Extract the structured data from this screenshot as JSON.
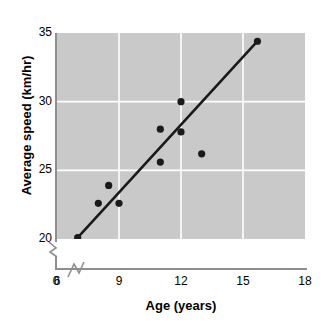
{
  "chart_data": {
    "type": "scatter",
    "title": "",
    "xlabel": "Age (years)",
    "ylabel": "Average speed (km/hr)",
    "xlim": [
      6,
      18
    ],
    "ylim": [
      20,
      35
    ],
    "xticks": [
      0,
      6,
      9,
      12,
      15,
      18
    ],
    "yticks": [
      20,
      25,
      30,
      35
    ],
    "xtick_labels": [
      "0",
      "6",
      "9",
      "12",
      "15",
      "18"
    ],
    "ytick_labels": [
      "20",
      "25",
      "30",
      "35"
    ],
    "grid": true,
    "grid_color": "#ffffff",
    "plot_background": "#c9c9c9",
    "axis_break_x": true,
    "axis_break_y": true,
    "marker_color": "#1a1a1a",
    "marker_shape": "circle",
    "x": [
      7.0,
      8.0,
      8.5,
      9.0,
      11.0,
      11.0,
      12.0,
      12.0,
      13.0,
      15.7
    ],
    "y": [
      20.1,
      22.6,
      23.9,
      22.6,
      25.6,
      28.0,
      27.8,
      30.0,
      26.2,
      34.4
    ],
    "points": [
      {
        "x": 7.0,
        "y": 20.1
      },
      {
        "x": 8.0,
        "y": 22.6
      },
      {
        "x": 8.5,
        "y": 23.9
      },
      {
        "x": 9.0,
        "y": 22.6
      },
      {
        "x": 11.0,
        "y": 25.6
      },
      {
        "x": 11.0,
        "y": 28.0
      },
      {
        "x": 12.0,
        "y": 27.8
      },
      {
        "x": 12.0,
        "y": 30.0
      },
      {
        "x": 13.0,
        "y": 26.2
      },
      {
        "x": 15.7,
        "y": 34.4
      }
    ],
    "trend_line": {
      "name": "line of best fit",
      "color": "#1a1a1a",
      "x_start": 7.0,
      "y_start": 20.1,
      "x_end": 15.7,
      "y_end": 34.4
    },
    "legend": null,
    "annotations": []
  }
}
